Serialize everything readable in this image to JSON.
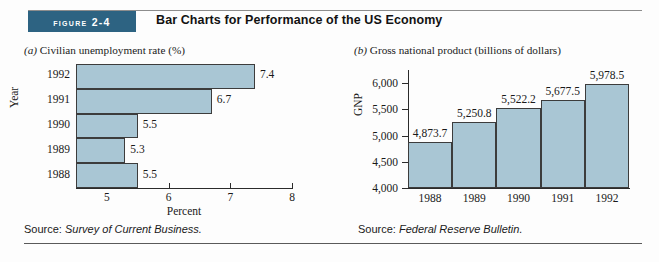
{
  "header": {
    "badge_label": "Figure 2-4",
    "title": "Bar Charts for Performance of the US Economy"
  },
  "colors": {
    "badge": "#2d6382",
    "bar_fill": "#a9c6d4",
    "bar_stroke": "#3c3c3c",
    "axis": "#2b2b2b",
    "page_background": "#fdfdfd"
  },
  "panel_a": {
    "caption_enum": "(a)",
    "caption_text": " Civilian unemployment rate (%)",
    "source_prefix": "Source: ",
    "source_title": "Survey of Current Business."
  },
  "panel_b": {
    "caption_enum": "(b)",
    "caption_text": " Gross national product (billions of dollars)",
    "source_prefix": "Source: ",
    "source_title": "Federal Reserve Bulletin."
  },
  "chart_data": [
    {
      "type": "bar",
      "orientation": "horizontal",
      "title": "(a) Civilian unemployment rate (%)",
      "categories": [
        "1992",
        "1991",
        "1990",
        "1989",
        "1988"
      ],
      "values": [
        7.4,
        6.7,
        5.5,
        5.3,
        5.5
      ],
      "data_labels": [
        "7.4",
        "6.7",
        "5.5",
        "5.3",
        "5.5"
      ],
      "xlabel": "Percent",
      "ylabel": "Year",
      "xlim": [
        4.5,
        8.0
      ],
      "xticks": [
        5,
        6,
        7,
        8
      ],
      "xticklabels": [
        "5",
        "6",
        "7",
        "8"
      ],
      "grid": false,
      "legend": false
    },
    {
      "type": "bar",
      "orientation": "vertical",
      "title": "(b) Gross national product (billions of dollars)",
      "categories": [
        "1988",
        "1989",
        "1990",
        "1991",
        "1992"
      ],
      "values": [
        4873.7,
        5250.8,
        5522.2,
        5677.5,
        5978.5
      ],
      "data_labels": [
        "4,873.7",
        "5,250.8",
        "5,522.2",
        "5,677.5",
        "5,978.5"
      ],
      "xlabel": "",
      "ylabel": "GNP",
      "ylim": [
        4000,
        6100
      ],
      "yticks": [
        4000,
        4500,
        5000,
        5500,
        6000
      ],
      "yticklabels": [
        "4,000",
        "4,500",
        "5,000",
        "5,500",
        "6,000"
      ],
      "grid": false,
      "legend": false
    }
  ]
}
